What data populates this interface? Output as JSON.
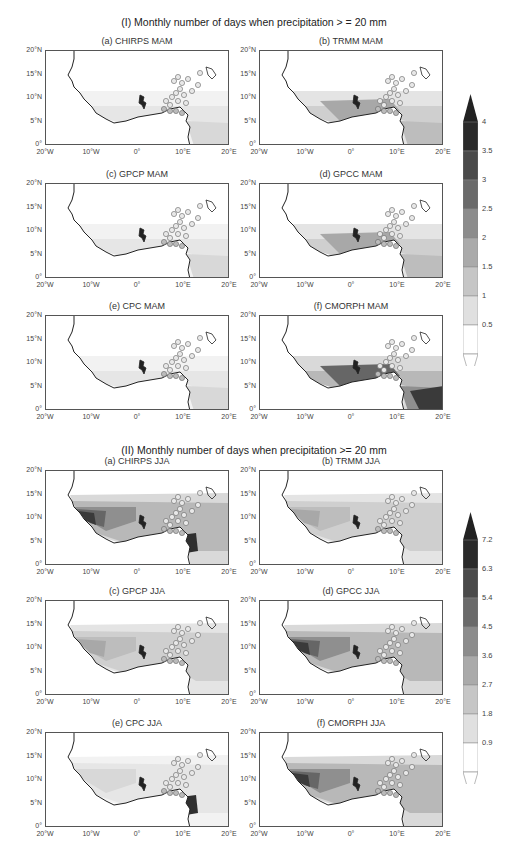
{
  "sections": [
    {
      "title": "(I) Monthly number of days when precipitation > = 20 mm",
      "panels": [
        "(a) CHIRPS MAM",
        "(b) TRMM MAM",
        "(c) GPCP MAM",
        "(d) GPCC MAM",
        "(e) CPC MAM",
        "(f) CMORPH MAM"
      ],
      "colorbar": [
        "4",
        "3.5",
        "3",
        "2.5",
        "2",
        "1.5",
        "1",
        "0.5"
      ]
    },
    {
      "title": "(II) Monthly number of days when precipitation >= 20 mm",
      "panels": [
        "(a) CHIRPS JJA",
        "(b) TRMM JJA",
        "(c) GPCP JJA",
        "(d) GPCC JJA",
        "(e) CPC JJA",
        "(f) CMORPH JJA"
      ],
      "colorbar": [
        "7.2",
        "6.3",
        "5.4",
        "4.5",
        "3.6",
        "2.7",
        "1.8",
        "0.9"
      ]
    }
  ],
  "axes": {
    "y_ticks": [
      "20°N",
      "15°N",
      "10°N",
      "5°N",
      "0°"
    ],
    "x_ticks": [
      "20°W",
      "10°W",
      "0°",
      "10°E",
      "20°E"
    ]
  },
  "chart_data": [
    {
      "type": "heatmap",
      "title": "(I) Monthly number of days when precipitation > = 20 mm",
      "season": "MAM",
      "panels": [
        "CHIRPS",
        "TRMM",
        "GPCP",
        "GPCC",
        "CPC",
        "CMORPH"
      ],
      "xlim": [
        "20°W",
        "20°E"
      ],
      "ylim": [
        "0°",
        "20°N"
      ],
      "x_ticks": [
        "20°W",
        "10°W",
        "0°",
        "10°E",
        "20°E"
      ],
      "y_ticks": [
        "0°",
        "5°N",
        "10°N",
        "15°N",
        "20°N"
      ],
      "colorbar_levels": [
        0.5,
        1,
        1.5,
        2,
        2.5,
        3,
        3.5,
        4
      ],
      "colorbar_extend": "both",
      "legend_position": "right"
    },
    {
      "type": "heatmap",
      "title": "(II) Monthly number of days when precipitation >= 20 mm",
      "season": "JJA",
      "panels": [
        "CHIRPS",
        "TRMM",
        "GPCP",
        "GPCC",
        "CPC",
        "CMORPH"
      ],
      "xlim": [
        "20°W",
        "20°E"
      ],
      "ylim": [
        "0°",
        "20°N"
      ],
      "x_ticks": [
        "20°W",
        "10°W",
        "0°",
        "10°E",
        "20°E"
      ],
      "y_ticks": [
        "0°",
        "5°N",
        "10°N",
        "15°N",
        "20°N"
      ],
      "colorbar_levels": [
        0.9,
        1.8,
        2.7,
        3.6,
        4.5,
        5.4,
        6.3,
        7.2
      ],
      "colorbar_extend": "both",
      "legend_position": "right"
    }
  ]
}
